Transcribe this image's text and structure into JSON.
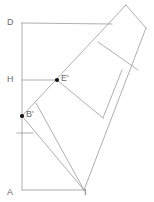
{
  "figure": {
    "type": "geometry-diagram",
    "width": 154,
    "height": 202,
    "background_color": "#ffffff",
    "stroke_color": "#9a9a9a",
    "accent_stroke_color": "#7a7a7a",
    "label_color": "#6b6b6b",
    "point_color": "#111111"
  },
  "labels": {
    "d": "D",
    "h": "H",
    "e_prime": "E'",
    "b_prime": "B'",
    "a": "A",
    "i": "I"
  },
  "points": [
    {
      "name": "D",
      "x": 22,
      "y": 23,
      "marked": false,
      "label": "D",
      "label_x": 7,
      "label_y": 18
    },
    {
      "name": "H",
      "x": 22,
      "y": 80,
      "marked": false,
      "label": "H",
      "label_x": 7,
      "label_y": 75
    },
    {
      "name": "E'",
      "x": 57,
      "y": 80,
      "marked": true,
      "label": "E'",
      "label_x": 61,
      "label_y": 74
    },
    {
      "name": "B'",
      "x": 22,
      "y": 116,
      "marked": true,
      "label": "B'",
      "label_x": 26,
      "label_y": 110
    },
    {
      "name": "A",
      "x": 22,
      "y": 190,
      "marked": false,
      "label": "A",
      "label_x": 7,
      "label_y": 188
    },
    {
      "name": "I",
      "x": 84,
      "y": 190,
      "marked": false,
      "label": "I",
      "label_x": 84,
      "label_y": 188
    }
  ],
  "segments": [
    {
      "name": "left-vertical-A-D",
      "x1": 22,
      "y1": 23,
      "x2": 22,
      "y2": 190
    },
    {
      "name": "top-edge-D-to-apex",
      "x1": 22,
      "y1": 23,
      "x2": 112,
      "y2": 24
    },
    {
      "name": "bottom-edge-A-to-I",
      "x1": 22,
      "y1": 190,
      "x2": 84,
      "y2": 190
    },
    {
      "name": "altitude-H-to-Eprime",
      "x1": 22,
      "y1": 80,
      "x2": 57,
      "y2": 80
    },
    {
      "name": "small-tick-segment",
      "x1": 17,
      "y1": 133,
      "x2": 33,
      "y2": 133
    },
    {
      "name": "diagonal-Bprime-to-apex",
      "x1": 22,
      "y1": 116,
      "x2": 126,
      "y2": 5
    },
    {
      "name": "diagonal-I-to-Eprime-up",
      "x1": 84,
      "y1": 190,
      "x2": 36,
      "y2": 103
    },
    {
      "name": "diagonal-Eprime-to-right",
      "x1": 57,
      "y1": 80,
      "x2": 103,
      "y2": 118
    },
    {
      "name": "right-edge-apex-to-I",
      "x1": 146,
      "y1": 28,
      "x2": 84,
      "y2": 190
    },
    {
      "name": "top-right-edge",
      "x1": 126,
      "y1": 5,
      "x2": 146,
      "y2": 28
    },
    {
      "name": "strip-divider-upper",
      "x1": 98,
      "y1": 42,
      "x2": 138,
      "y2": 70
    },
    {
      "name": "strip-divider-lower",
      "x1": 103,
      "y1": 118,
      "x2": 122,
      "y2": 70
    },
    {
      "name": "left-fan-Bprime-to-I",
      "x1": 22,
      "y1": 116,
      "x2": 84,
      "y2": 190
    }
  ]
}
